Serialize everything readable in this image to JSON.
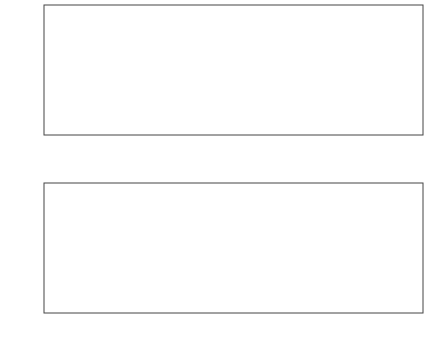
{
  "chart_data": [
    {
      "type": "line",
      "title": "",
      "xlabel": "",
      "ylabel": "p",
      "xlim": [
        0,
        23.5
      ],
      "ylim": [
        0,
        1
      ],
      "xticks": [
        0,
        5,
        10,
        15,
        20
      ],
      "yticks": [
        0,
        0.2,
        0.4,
        0.6,
        0.8,
        1
      ],
      "ytick_labels": [
        "0",
        "0.2",
        "0.4",
        "0.6",
        "0.8",
        "1"
      ],
      "grid": false,
      "markers_vertical": [
        5.4,
        17.4
      ],
      "series": [
        {
          "name": "p",
          "description": "oscillatory peaks",
          "peaks": [
            {
              "t": 0.0,
              "p": 0.8
            },
            {
              "t": 1.0,
              "p": 0.8
            },
            {
              "t": 2.0,
              "p": 0.8
            },
            {
              "t": 3.0,
              "p": 0.8
            },
            {
              "t": 4.0,
              "p": 0.8
            },
            {
              "t": 5.0,
              "p": 0.81
            },
            {
              "t": 5.7,
              "p": 0.33
            },
            {
              "t": 6.2,
              "p": 0.29
            },
            {
              "t": 6.8,
              "p": 0.26
            },
            {
              "t": 7.4,
              "p": 0.29
            },
            {
              "t": 7.9,
              "p": 0.27
            },
            {
              "t": 8.5,
              "p": 0.28
            },
            {
              "t": 9.1,
              "p": 0.28
            },
            {
              "t": 9.7,
              "p": 0.28
            },
            {
              "t": 10.3,
              "p": 0.28
            },
            {
              "t": 10.9,
              "p": 0.28
            },
            {
              "t": 11.5,
              "p": 0.28
            },
            {
              "t": 12.1,
              "p": 0.28
            },
            {
              "t": 12.7,
              "p": 0.28
            },
            {
              "t": 13.3,
              "p": 0.28
            },
            {
              "t": 13.9,
              "p": 0.28
            },
            {
              "t": 14.5,
              "p": 0.28
            },
            {
              "t": 15.1,
              "p": 0.28
            },
            {
              "t": 15.7,
              "p": 0.28
            },
            {
              "t": 16.3,
              "p": 0.28
            },
            {
              "t": 16.9,
              "p": 0.28
            },
            {
              "t": 18.0,
              "p": 0.69
            },
            {
              "t": 19.0,
              "p": 0.72
            },
            {
              "t": 20.0,
              "p": 0.76
            },
            {
              "t": 21.0,
              "p": 0.78
            },
            {
              "t": 22.0,
              "p": 0.8
            },
            {
              "t": 23.0,
              "p": 0.81
            }
          ]
        }
      ]
    },
    {
      "type": "line",
      "title": "",
      "xlabel": "Time",
      "ylabel": "I_1",
      "xlim": [
        0,
        23.5
      ],
      "ylim": [
        0,
        14.5
      ],
      "xticks": [
        0,
        5,
        10,
        15,
        20
      ],
      "yticks": [
        0,
        5,
        10
      ],
      "grid": false,
      "series": [
        {
          "name": "I1",
          "description": "pulse train",
          "pulse_amplitude": 12,
          "pulse_start": 5.4,
          "pulse_end": 17.2,
          "pulse_count": 24,
          "pulse_period": 0.5
        }
      ]
    }
  ],
  "top": {
    "ylabel": "p",
    "xticks": [
      "0",
      "5",
      "10",
      "15",
      "20"
    ],
    "yticks": [
      "0",
      "0.2",
      "0.4",
      "0.6",
      "0.8",
      "1"
    ]
  },
  "bottom": {
    "ylabel": "I",
    "ylabel_sub": "1",
    "xlabel": "Time",
    "xticks": [
      "0",
      "5",
      "10",
      "15",
      "20"
    ],
    "yticks": [
      "0",
      "5",
      "10"
    ]
  }
}
